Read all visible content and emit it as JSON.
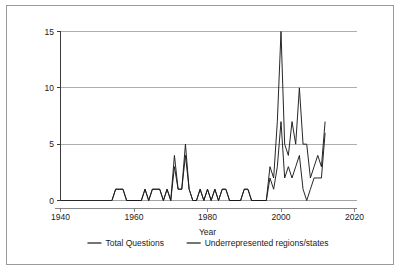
{
  "figure": {
    "background_color": "#ffffff",
    "frame_color": "#9a9a9a"
  },
  "chart_data": {
    "type": "line",
    "title": "",
    "subtitle": "",
    "xlabel": "Year",
    "ylabel": "",
    "xlim": [
      1940,
      2020
    ],
    "ylim": [
      0,
      15
    ],
    "xticks": [
      1940,
      1960,
      1980,
      2000,
      2020
    ],
    "yticks": [
      0,
      5,
      10,
      15
    ],
    "xtick_labels": [
      "1940",
      "1960",
      "1980",
      "2000",
      "2020"
    ],
    "ytick_labels": [
      "0",
      "5",
      "10",
      "15"
    ],
    "grid": "horizontal",
    "legend_position": "bottom",
    "line_color": "#1a1a1a",
    "series": [
      {
        "name": "Total Questions",
        "color": "#1a1a1a",
        "x": [
          1954,
          1955,
          1956,
          1957,
          1958,
          1959,
          1960,
          1961,
          1962,
          1963,
          1964,
          1965,
          1966,
          1967,
          1968,
          1969,
          1970,
          1971,
          1972,
          1973,
          1974,
          1975,
          1976,
          1977,
          1978,
          1979,
          1980,
          1981,
          1982,
          1983,
          1984,
          1985,
          1986,
          1987,
          1988,
          1989,
          1990,
          1991,
          1992,
          1993,
          1994,
          1995,
          1996,
          1997,
          1998,
          1999,
          2000,
          2001,
          2002,
          2003,
          2004,
          2005,
          2006,
          2007,
          2008,
          2009,
          2010,
          2011,
          2012
        ],
        "values": [
          0,
          1,
          1,
          1,
          0,
          0,
          0,
          0,
          0,
          1,
          0,
          1,
          1,
          1,
          0,
          1,
          0,
          4,
          1,
          1,
          5,
          1,
          0,
          0,
          1,
          0,
          1,
          0,
          1,
          0,
          1,
          1,
          0,
          0,
          0,
          0,
          1,
          1,
          0,
          0,
          0,
          0,
          0,
          3,
          2,
          7,
          15,
          5,
          4,
          7,
          5,
          10,
          5,
          5,
          2,
          3,
          4,
          3,
          7
        ]
      },
      {
        "name": "Underrepresented regions/states",
        "color": "#1a1a1a",
        "x": [
          1954,
          1955,
          1956,
          1957,
          1958,
          1959,
          1960,
          1961,
          1962,
          1963,
          1964,
          1965,
          1966,
          1967,
          1968,
          1969,
          1970,
          1971,
          1972,
          1973,
          1974,
          1975,
          1976,
          1977,
          1978,
          1979,
          1980,
          1981,
          1982,
          1983,
          1984,
          1985,
          1986,
          1987,
          1988,
          1989,
          1990,
          1991,
          1992,
          1993,
          1994,
          1995,
          1996,
          1997,
          1998,
          1999,
          2000,
          2001,
          2002,
          2003,
          2004,
          2005,
          2006,
          2007,
          2008,
          2009,
          2010,
          2011,
          2012
        ],
        "values": [
          0,
          1,
          1,
          1,
          0,
          0,
          0,
          0,
          0,
          1,
          0,
          1,
          1,
          1,
          0,
          1,
          0,
          3,
          1,
          1,
          4,
          1,
          0,
          0,
          1,
          0,
          1,
          0,
          1,
          0,
          1,
          1,
          0,
          0,
          0,
          0,
          1,
          1,
          0,
          0,
          0,
          0,
          0,
          2,
          1,
          3,
          7,
          2,
          3,
          2,
          3,
          4,
          1,
          0,
          1,
          2,
          2,
          2,
          6
        ]
      }
    ],
    "legend": [
      {
        "label": "Total Questions",
        "color": "#1a1a1a"
      },
      {
        "label": "Underrepresented regions/states",
        "color": "#1a1a1a"
      }
    ]
  }
}
